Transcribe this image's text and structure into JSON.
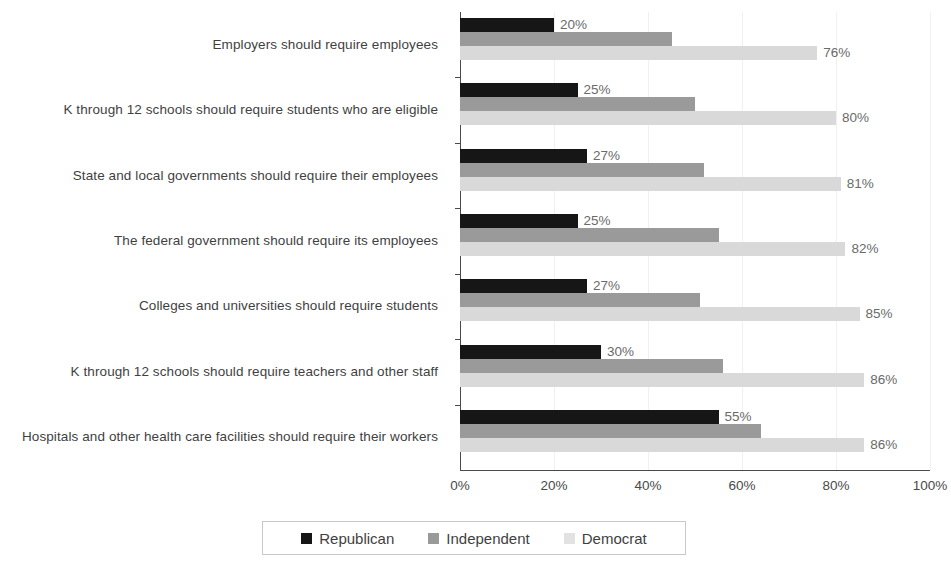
{
  "chart_data": {
    "type": "bar",
    "orientation": "horizontal",
    "title": "",
    "xlabel": "",
    "ylabel": "",
    "xlim": [
      0,
      100
    ],
    "xticks": [
      "0%",
      "20%",
      "40%",
      "60%",
      "80%",
      "100%"
    ],
    "xtick_values": [
      0,
      20,
      40,
      60,
      80,
      100
    ],
    "grid": true,
    "legend_position": "bottom",
    "categories": [
      "Employers should require employees",
      "K through 12 schools should require students who are eligible",
      "State and local governments should require their employees",
      "The federal government should require its employees",
      "Colleges and universities should require students",
      "K through 12 schools should require teachers and other staff",
      "Hospitals and other health care facilities should require their workers"
    ],
    "series": [
      {
        "name": "Republican",
        "color": "#161616",
        "values": [
          20,
          25,
          27,
          25,
          27,
          30,
          55
        ],
        "labels": [
          "20%",
          "25%",
          "27%",
          "25%",
          "27%",
          "30%",
          "55%"
        ],
        "labels_shown": true
      },
      {
        "name": "Independent",
        "color": "#9a9a9a",
        "values": [
          45,
          50,
          52,
          55,
          51,
          56,
          64
        ],
        "labels": [
          "",
          "",
          "",
          "",
          "",
          "",
          ""
        ],
        "labels_shown": false
      },
      {
        "name": "Democrat",
        "color": "#d9d9d9",
        "values": [
          76,
          80,
          81,
          82,
          85,
          86,
          86
        ],
        "labels": [
          "76%",
          "80%",
          "81%",
          "82%",
          "85%",
          "86%",
          "86%"
        ],
        "labels_shown": true
      }
    ]
  },
  "legend": {
    "items": [
      {
        "label": "Republican",
        "swatch": "rep"
      },
      {
        "label": "Independent",
        "swatch": "ind"
      },
      {
        "label": "Democrat",
        "swatch": "dem"
      }
    ]
  }
}
